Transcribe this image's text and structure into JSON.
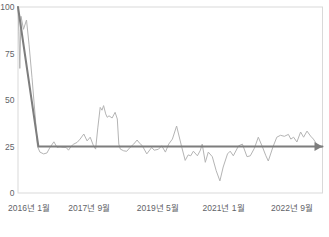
{
  "chart_data": {
    "type": "line",
    "title": "",
    "xlabel": "",
    "ylabel": "",
    "x_axis": {
      "tick_labels": [
        "2016년 1월",
        "2017년 9월",
        "2019년 5월",
        "2021년 1월",
        "2022년 9월"
      ],
      "tick_positions_pct": [
        3.6,
        23.4,
        45.9,
        67.5,
        90.0
      ]
    },
    "y_axis": {
      "ticks": [
        0,
        25,
        50,
        75,
        100
      ],
      "range": [
        0,
        100
      ]
    },
    "layout": {
      "grid": false,
      "legend": "none",
      "frame": true
    },
    "series": [
      {
        "name": "interest-over-time",
        "color": "#b4b4b4",
        "width": 1,
        "arrow_end": false,
        "points": [
          [
            0,
            100
          ],
          [
            0.3,
            87
          ],
          [
            0.6,
            67
          ],
          [
            1.0,
            95
          ],
          [
            1.8,
            88
          ],
          [
            2.8,
            93
          ],
          [
            3.6,
            80
          ],
          [
            4.6,
            62
          ],
          [
            5.6,
            42
          ],
          [
            6.4,
            25
          ],
          [
            7.2,
            22
          ],
          [
            8.4,
            21
          ],
          [
            9.5,
            21.5
          ],
          [
            10.5,
            24.5
          ],
          [
            11.8,
            27.5
          ],
          [
            12.8,
            24.5
          ],
          [
            13.8,
            24.8
          ],
          [
            14.8,
            24.5
          ],
          [
            15.8,
            24.5
          ],
          [
            16.6,
            23
          ],
          [
            17.4,
            25
          ],
          [
            18.3,
            26.3
          ],
          [
            19.4,
            27.2
          ],
          [
            20.4,
            29
          ],
          [
            21.6,
            31.7
          ],
          [
            22.7,
            28
          ],
          [
            23.7,
            30
          ],
          [
            24.8,
            25.4
          ],
          [
            25.5,
            23.6
          ],
          [
            26.2,
            35
          ],
          [
            27.0,
            46
          ],
          [
            27.6,
            44.5
          ],
          [
            28.1,
            47
          ],
          [
            28.8,
            42.5
          ],
          [
            29.3,
            40.7
          ],
          [
            29.9,
            41.5
          ],
          [
            30.9,
            40.3
          ],
          [
            31.9,
            43.4
          ],
          [
            32.6,
            39.8
          ],
          [
            33.1,
            26.3
          ],
          [
            33.6,
            23.6
          ],
          [
            34.7,
            22.7
          ],
          [
            35.7,
            22.4
          ],
          [
            36.8,
            24.5
          ],
          [
            38.0,
            26.3
          ],
          [
            39.1,
            28.5
          ],
          [
            39.8,
            27
          ],
          [
            40.8,
            25.5
          ],
          [
            42.3,
            21
          ],
          [
            43.9,
            24.5
          ],
          [
            44.7,
            23
          ],
          [
            46.1,
            23.5
          ],
          [
            47.2,
            25.4
          ],
          [
            48.4,
            22
          ],
          [
            49.5,
            26.3
          ],
          [
            50.7,
            29
          ],
          [
            52.1,
            36
          ],
          [
            53.8,
            24.5
          ],
          [
            54.9,
            17.5
          ],
          [
            55.9,
            20.5
          ],
          [
            56.7,
            20
          ],
          [
            57.6,
            22.5
          ],
          [
            58.9,
            20
          ],
          [
            59.9,
            23
          ],
          [
            60.5,
            26.3
          ],
          [
            61.5,
            16.5
          ],
          [
            62.5,
            22
          ],
          [
            63.8,
            19.5
          ],
          [
            65.1,
            12
          ],
          [
            66.3,
            6.5
          ],
          [
            67.4,
            14
          ],
          [
            68.8,
            21
          ],
          [
            69.7,
            22.5
          ],
          [
            70.7,
            20
          ],
          [
            72.4,
            25.3
          ],
          [
            73.7,
            26.3
          ],
          [
            75.2,
            19.5
          ],
          [
            76.3,
            20
          ],
          [
            77.6,
            24
          ],
          [
            78.9,
            30
          ],
          [
            80.3,
            24.7
          ],
          [
            81.4,
            20
          ],
          [
            82.2,
            17.2
          ],
          [
            83.7,
            24.7
          ],
          [
            85.0,
            30
          ],
          [
            86.2,
            31
          ],
          [
            87.5,
            30.5
          ],
          [
            88.8,
            31.5
          ],
          [
            89.6,
            29
          ],
          [
            90.5,
            30
          ],
          [
            91.6,
            27.4
          ],
          [
            92.8,
            32.8
          ],
          [
            93.8,
            30
          ],
          [
            94.9,
            33.3
          ],
          [
            96.1,
            30.6
          ],
          [
            97.0,
            29
          ],
          [
            98.5,
            25.3
          ],
          [
            99.8,
            24.5
          ]
        ]
      },
      {
        "name": "trend-overlay",
        "color": "#7d7d7d",
        "width": 2,
        "arrow_end": true,
        "points": [
          [
            0,
            100
          ],
          [
            6.7,
            25
          ],
          [
            100,
            25
          ]
        ]
      }
    ]
  },
  "colors": {
    "frame": "#d9d9d9",
    "tick_text": "#5f6368",
    "background": "#ffffff"
  }
}
